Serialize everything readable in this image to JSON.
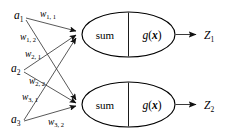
{
  "diagram": {
    "background_color": "#ffffff",
    "stroke_color": "#000000",
    "connector_color": "#3a3a3a",
    "inputs": [
      {
        "id": "a1",
        "base": "a",
        "subscript": "1",
        "x": 14,
        "y": 19
      },
      {
        "id": "a2",
        "base": "a",
        "subscript": "2",
        "x": 11,
        "y": 72
      },
      {
        "id": "a3",
        "base": "a",
        "subscript": "3",
        "x": 11,
        "y": 123
      }
    ],
    "weights": [
      {
        "id": "w11",
        "base": "w",
        "subscript": "1, 1",
        "x": 40,
        "y": 17
      },
      {
        "id": "w12",
        "base": "w",
        "subscript": "1, 2",
        "x": 20,
        "y": 40
      },
      {
        "id": "w21",
        "base": "w",
        "subscript": "2, 1",
        "x": 25,
        "y": 57
      },
      {
        "id": "w22",
        "base": "w",
        "subscript": "2, 2",
        "x": 29,
        "y": 84
      },
      {
        "id": "w31",
        "base": "w",
        "subscript": "3, 1",
        "x": 22,
        "y": 100
      },
      {
        "id": "w32",
        "base": "w",
        "subscript": "3, 2",
        "x": 48,
        "y": 125
      }
    ],
    "nodes": [
      {
        "id": "node1",
        "sum_label": "sum",
        "activation_base": "g",
        "activation_open": "(",
        "activation_var": "x",
        "activation_close": ")",
        "cx": 128.5,
        "cy": 34.5,
        "rx": 46.5,
        "ry": 22.5,
        "divider_x": 128.5
      },
      {
        "id": "node2",
        "sum_label": "sum",
        "activation_base": "g",
        "activation_open": "(",
        "activation_var": "x",
        "activation_close": ")",
        "cx": 128.5,
        "cy": 104.5,
        "rx": 46.5,
        "ry": 22.5,
        "divider_x": 128.5
      }
    ],
    "outputs": [
      {
        "id": "z1",
        "base": "Z",
        "subscript": "1",
        "x": 206,
        "y": 39,
        "arrow_y": 34.5
      },
      {
        "id": "z2",
        "base": "Z",
        "subscript": "2",
        "x": 206,
        "y": 109,
        "arrow_y": 104.5
      }
    ],
    "connections": [
      {
        "id": "a1-node1",
        "from": "a1",
        "to": "node1",
        "weight": "w11",
        "x1": 26,
        "y1": 18,
        "x2": 78,
        "y2": 32
      },
      {
        "id": "a1-node2",
        "from": "a1",
        "to": "node2",
        "weight": "w12",
        "x1": 26,
        "y1": 20,
        "x2": 78,
        "y2": 102
      },
      {
        "id": "a2-node1",
        "from": "a2",
        "to": "node1",
        "weight": "w21",
        "x1": 24,
        "y1": 70,
        "x2": 78,
        "y2": 36
      },
      {
        "id": "a2-node2",
        "from": "a2",
        "to": "node2",
        "weight": "w22",
        "x1": 24,
        "y1": 72,
        "x2": 78,
        "y2": 104
      },
      {
        "id": "a3-node1",
        "from": "a3",
        "to": "node1",
        "weight": "w31",
        "x1": 24,
        "y1": 120,
        "x2": 78,
        "y2": 38
      },
      {
        "id": "a3-node2",
        "from": "a3",
        "to": "node2",
        "weight": "w32",
        "x1": 24,
        "y1": 121,
        "x2": 78,
        "y2": 106
      }
    ]
  }
}
